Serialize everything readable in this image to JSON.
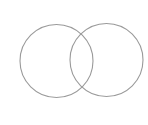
{
  "diagram": {
    "type": "venn",
    "background": "#ffffff",
    "stroke_color": "#9a9a9a",
    "stroke_width": 1.1,
    "circles": [
      {
        "name": "left",
        "cx": 56.5,
        "cy": 61,
        "r": 36.5
      },
      {
        "name": "right",
        "cx": 106.5,
        "cy": 60,
        "r": 36.5
      }
    ]
  }
}
